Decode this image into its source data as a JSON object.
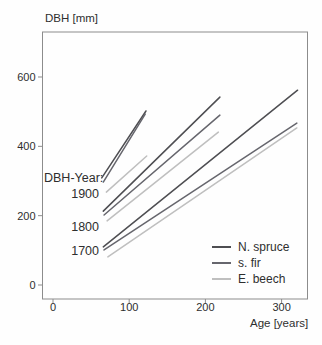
{
  "window": {
    "width": 322,
    "height": 345
  },
  "colors": {
    "n_spruce": "#4e4e52",
    "s_fir": "#66666d",
    "e_beech": "#bfbfbf",
    "axis": "#8c8c8c",
    "text": "#2e2e2e"
  },
  "chart_data": {
    "type": "line",
    "title": "",
    "ylabel": "DBH [mm]",
    "xlabel": "Age [years]",
    "x_ticks": [
      0,
      100,
      200,
      300
    ],
    "y_ticks": [
      0,
      200,
      400,
      600
    ],
    "xlim": [
      -14,
      334
    ],
    "ylim": [
      -40,
      730
    ],
    "grid": false,
    "annotation_header": "DBH-Year:",
    "year_labels": [
      "1900",
      "1800",
      "1700"
    ],
    "legend": {
      "position": "inside-bottom-right",
      "items": [
        {
          "label": "N. spruce",
          "color_key": "n_spruce"
        },
        {
          "label": "s. fir",
          "color_key": "s_fir"
        },
        {
          "label": "E. beech",
          "color_key": "e_beech"
        }
      ]
    },
    "series": [
      {
        "name": "1900 N. spruce",
        "year": 1900,
        "species": "N. spruce",
        "color_key": "n_spruce",
        "x": [
          64,
          122
        ],
        "y": [
          309,
          502
        ]
      },
      {
        "name": "1900 s. fir",
        "year": 1900,
        "species": "s. fir",
        "color_key": "s_fir",
        "x": [
          66,
          121
        ],
        "y": [
          297,
          493
        ]
      },
      {
        "name": "1900 E. beech",
        "year": 1900,
        "species": "E. beech",
        "color_key": "e_beech",
        "x": [
          70,
          123
        ],
        "y": [
          268,
          372
        ]
      },
      {
        "name": "1800 N. spruce",
        "year": 1800,
        "species": "N. spruce",
        "color_key": "n_spruce",
        "x": [
          66,
          219
        ],
        "y": [
          213,
          542
        ]
      },
      {
        "name": "1800 s. fir",
        "year": 1800,
        "species": "s. fir",
        "color_key": "s_fir",
        "x": [
          67,
          219
        ],
        "y": [
          202,
          490
        ]
      },
      {
        "name": "1800 E. beech",
        "year": 1800,
        "species": "E. beech",
        "color_key": "e_beech",
        "x": [
          71,
          217
        ],
        "y": [
          185,
          441
        ]
      },
      {
        "name": "1700 N. spruce",
        "year": 1700,
        "species": "N. spruce",
        "color_key": "n_spruce",
        "x": [
          66,
          321
        ],
        "y": [
          110,
          562
        ]
      },
      {
        "name": "1700 s. fir",
        "year": 1700,
        "species": "s. fir",
        "color_key": "s_fir",
        "x": [
          67,
          320
        ],
        "y": [
          101,
          467
        ]
      },
      {
        "name": "1700 E. beech",
        "year": 1700,
        "species": "E. beech",
        "color_key": "e_beech",
        "x": [
          72,
          320
        ],
        "y": [
          81,
          453
        ]
      }
    ]
  }
}
